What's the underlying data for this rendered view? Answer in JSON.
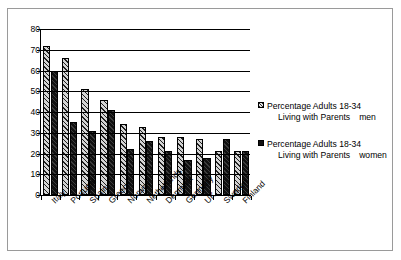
{
  "chart_data": {
    "type": "bar",
    "title": "",
    "xlabel": "",
    "ylabel": "",
    "ylim": [
      0,
      80
    ],
    "yticks": [
      0,
      10,
      20,
      30,
      40,
      50,
      60,
      70,
      80
    ],
    "grid": true,
    "legend_position": "right",
    "categories": [
      "Italy",
      "Portugal",
      "Spain",
      "Greece",
      "Norway",
      "Nethetlands",
      "Denmark",
      "Germany",
      "UK",
      "Sweden",
      "Finland"
    ],
    "series": [
      {
        "name": "Percentage Adults 18-34 Living with Parents   men",
        "name_line1": "Percentage Adults 18-34",
        "name_line2": "Living with Parents",
        "name_tail": "men",
        "swatch": "hatched-light",
        "values": [
          72,
          66,
          51,
          46,
          34,
          33,
          28,
          28,
          27,
          21,
          21
        ]
      },
      {
        "name": "Percentage Adults 18-34 Living with Parents   women",
        "name_line1": "Percentage Adults 18-34",
        "name_line2": "Living with Parents",
        "name_tail": "women",
        "swatch": "solid-black",
        "values": [
          60,
          35,
          31,
          41,
          22,
          26,
          21,
          17,
          18,
          27,
          21
        ]
      }
    ]
  },
  "colors": {
    "series_men": "#d4d4d4",
    "series_women": "#111111",
    "axis": "#000000",
    "frame": "#9a9a9a",
    "background": "#ffffff"
  }
}
